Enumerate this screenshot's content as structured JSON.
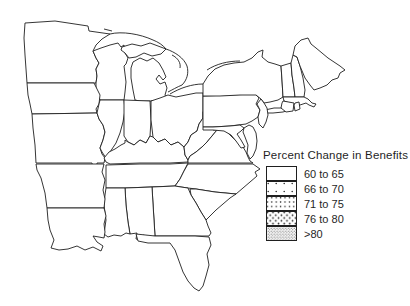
{
  "figure": {
    "type": "choropleth-map",
    "region": "Eastern United States",
    "colors": {
      "ink": "#1f1f1f",
      "background": "#ffffff"
    },
    "legend": {
      "title": "Percent Change in Benefits",
      "items": [
        {
          "label": "60 to 65",
          "pattern": "none"
        },
        {
          "label": "66 to 70",
          "pattern": "dots-sparse"
        },
        {
          "label": "71 to 75",
          "pattern": "dots-medium"
        },
        {
          "label": "76 to 80",
          "pattern": "dots-dense"
        },
        {
          "label": ">80",
          "pattern": "stipple"
        }
      ]
    },
    "state_classes": {
      "MN": "71 to 75",
      "WI": "71 to 75",
      "MI": "66 to 70",
      "IA": "76 to 80",
      "MO": ">80",
      "IL": ">80",
      "IN": ">80",
      "OH": "60 to 65",
      "KY": ">80",
      "TN": ">80",
      "WV": "60 to 65",
      "VA": "60 to 65",
      "NC": "66 to 70",
      "SC": "71 to 75",
      "GA": "71 to 75",
      "FL": "71 to 75",
      "AL": ">80",
      "MS": ">80",
      "AR": ">80",
      "LA": ">80",
      "PA": "60 to 65",
      "NY": "60 to 65",
      "NJ": "60 to 65",
      "MD": "60 to 65",
      "DE": "60 to 65",
      "VT": "60 to 65",
      "NH": "60 to 65",
      "ME": "60 to 65",
      "MA": "60 to 65",
      "CT": "60 to 65",
      "RI": "60 to 65"
    }
  }
}
